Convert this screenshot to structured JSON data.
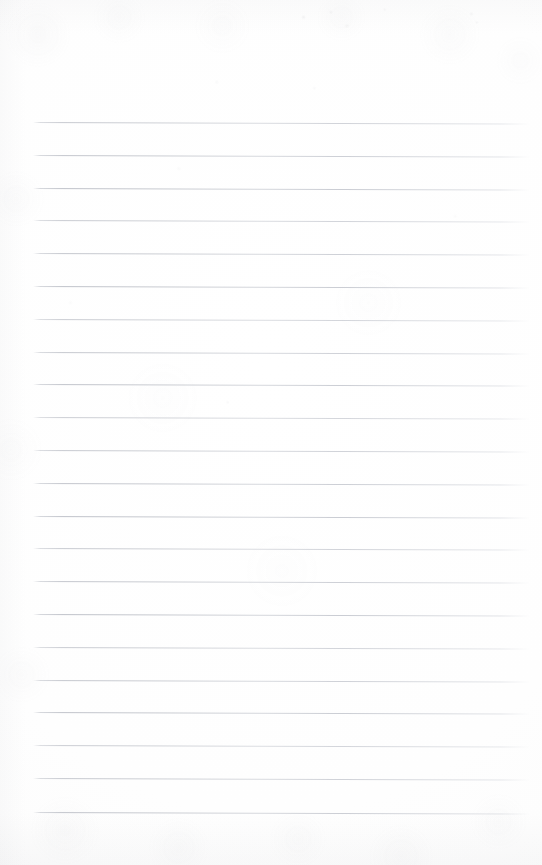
{
  "document": {
    "kind": "scanned-lined-notepad-page",
    "page_width_px": 542,
    "page_height_px": 865,
    "background_color": "#fefefe",
    "paper_tone_color": "#fcfcfc",
    "has_visible_text": false,
    "has_handwriting": false,
    "text_content": ""
  },
  "ruling": {
    "line_count": 22,
    "line_color": "#bdc0c8",
    "line_thickness_px": 1,
    "first_line_y_px": 122,
    "line_spacing_px": 32.85,
    "line_start_x_px": 33,
    "line_end_x_px": 530,
    "line_length_px": 497,
    "skew_degrees": 0.18,
    "top_margin_px": 122,
    "bottom_margin_px": 53,
    "left_margin_px": 33,
    "right_margin_px": 12,
    "lines": [
      {
        "index": 1,
        "y_px": 122
      },
      {
        "index": 2,
        "y_px": 155
      },
      {
        "index": 3,
        "y_px": 188
      },
      {
        "index": 4,
        "y_px": 220
      },
      {
        "index": 5,
        "y_px": 253
      },
      {
        "index": 6,
        "y_px": 286
      },
      {
        "index": 7,
        "y_px": 319
      },
      {
        "index": 8,
        "y_px": 352
      },
      {
        "index": 9,
        "y_px": 384
      },
      {
        "index": 10,
        "y_px": 417
      },
      {
        "index": 11,
        "y_px": 450
      },
      {
        "index": 12,
        "y_px": 483
      },
      {
        "index": 13,
        "y_px": 516
      },
      {
        "index": 14,
        "y_px": 548
      },
      {
        "index": 15,
        "y_px": 581
      },
      {
        "index": 16,
        "y_px": 614
      },
      {
        "index": 17,
        "y_px": 647
      },
      {
        "index": 18,
        "y_px": 680
      },
      {
        "index": 19,
        "y_px": 712
      },
      {
        "index": 20,
        "y_px": 745
      },
      {
        "index": 21,
        "y_px": 778
      },
      {
        "index": 22,
        "y_px": 812
      }
    ]
  }
}
